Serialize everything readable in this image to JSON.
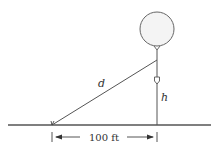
{
  "diagram": {
    "labels": {
      "distance": "d",
      "height": "h",
      "horizontal_distance": "100 ft"
    },
    "colors": {
      "stroke": "#555555",
      "balloon_fill": "#f4f4f4",
      "text": "#333333"
    }
  }
}
